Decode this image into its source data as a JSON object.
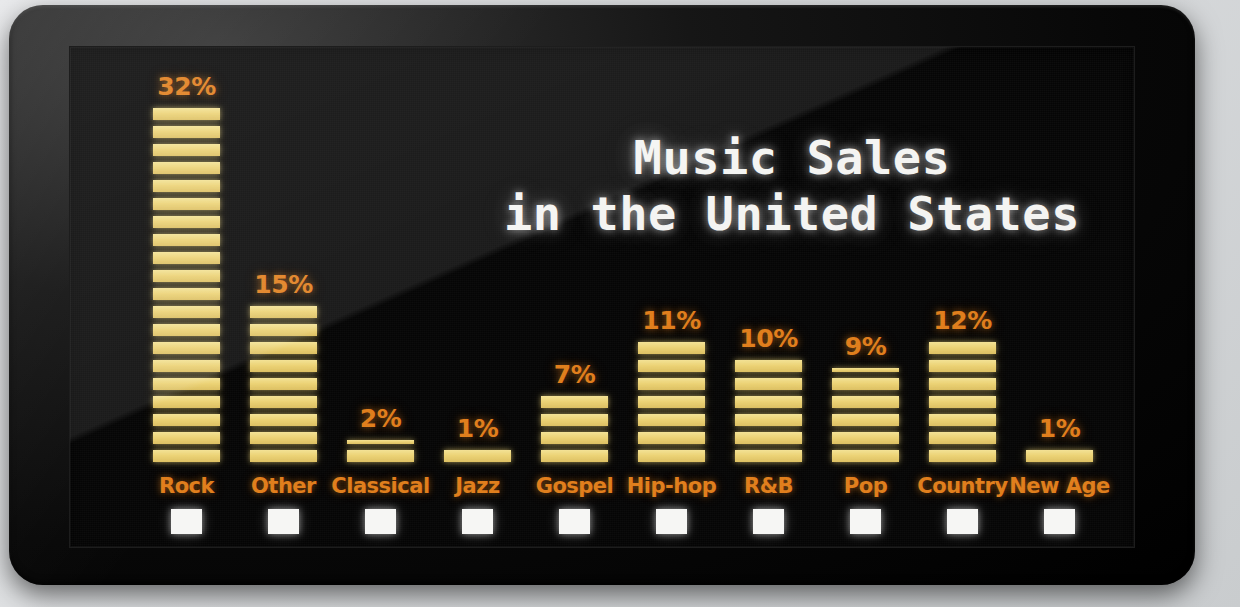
{
  "device": {
    "screen_background": "#050505",
    "bezel_color": "#0b0b0b"
  },
  "title": {
    "text": "Music Sales\nin the United States",
    "color": "#f4f4f2"
  },
  "colors": {
    "bar": "#ecd375",
    "label": "#e07d1a",
    "value": "#e07d1a",
    "swatch": "#f6f6f4",
    "title": "#f4f4f2",
    "screen": "#050505"
  },
  "chart_data": {
    "type": "bar",
    "title": "Music Sales in the United States",
    "xlabel": "",
    "ylabel": "",
    "unit": "%",
    "ylim": [
      0,
      32
    ],
    "grid": false,
    "legend": "none",
    "orientation": "vertical",
    "categories": [
      "Rock",
      "Other",
      "Classical",
      "Jazz",
      "Gospel",
      "Hip-hop",
      "R&B",
      "Pop",
      "Country",
      "New Age"
    ],
    "values": [
      32,
      15,
      2,
      1,
      7,
      11,
      10,
      9,
      12,
      1
    ],
    "value_labels": [
      "32%",
      "15%",
      "2%",
      "1%",
      "7%",
      "11%",
      "10%",
      "9%",
      "12%",
      "1%"
    ]
  },
  "bars": [
    {
      "label": "Rock",
      "value": 32,
      "value_label": "32%",
      "segments": 20,
      "partial": false
    },
    {
      "label": "Other",
      "value": 15,
      "value_label": "15%",
      "segments": 9,
      "partial": false
    },
    {
      "label": "Classical",
      "value": 2,
      "value_label": "2%",
      "segments": 1,
      "partial": true
    },
    {
      "label": "Jazz",
      "value": 1,
      "value_label": "1%",
      "segments": 1,
      "partial": false
    },
    {
      "label": "Gospel",
      "value": 7,
      "value_label": "7%",
      "segments": 4,
      "partial": false
    },
    {
      "label": "Hip-hop",
      "value": 11,
      "value_label": "11%",
      "segments": 7,
      "partial": false
    },
    {
      "label": "R&B",
      "value": 10,
      "value_label": "10%",
      "segments": 6,
      "partial": false
    },
    {
      "label": "Pop",
      "value": 9,
      "value_label": "9%",
      "segments": 5,
      "partial": true
    },
    {
      "label": "Country",
      "value": 12,
      "value_label": "12%",
      "segments": 7,
      "partial": false
    },
    {
      "label": "New Age",
      "value": 1,
      "value_label": "1%",
      "segments": 1,
      "partial": false
    }
  ]
}
